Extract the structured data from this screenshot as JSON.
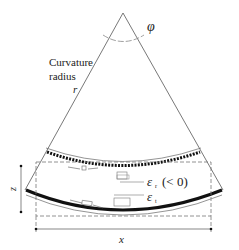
{
  "diagram": {
    "angle_label": "φ",
    "radius_label_line1": "Curvature",
    "radius_label_line2": "radius",
    "radius_symbol": "r",
    "strain_top_symbol": "ε",
    "strain_top_sub": "r",
    "strain_top_note": "(< 0)",
    "strain_bottom_symbol": "ε",
    "strain_bottom_sub": "t",
    "height_label": "z",
    "width_label": "x"
  },
  "colors": {
    "line": "#555555",
    "thick": "#111111",
    "dash": "#777777"
  }
}
